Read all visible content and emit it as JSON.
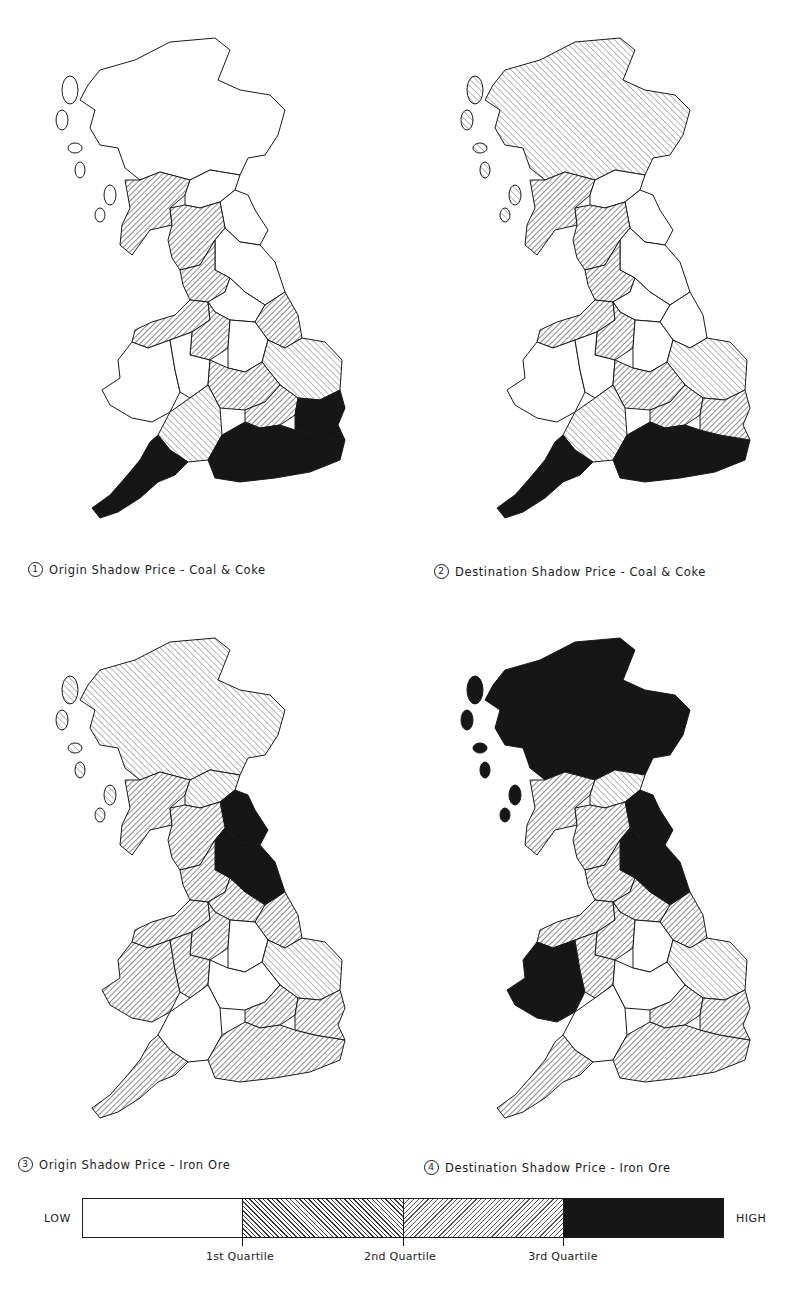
{
  "figure": {
    "panels": [
      {
        "number": "1",
        "caption": "Origin Shadow Price - Coal & Coke",
        "classes": {
          "highlands": "low",
          "southern_scotland": "q2",
          "borders": "low",
          "north_east": "low",
          "cumbria": "q2",
          "yorkshire_north": "low",
          "lancashire": "q2",
          "yorkshire_south": "low",
          "lincolnshire": "q2",
          "north_wales": "q2",
          "midlands_west": "q2",
          "midlands_east": "low",
          "wales": "low",
          "welsh_marches": "low",
          "east_anglia": "q3",
          "south_midlands": "q2",
          "severn_wessex": "q3",
          "london_home": "q2",
          "south_west": "high",
          "south_coast": "high",
          "kent_essex": "high"
        }
      },
      {
        "number": "2",
        "caption": "Destination Shadow Price - Coal & Coke",
        "classes": {
          "highlands": "q3",
          "southern_scotland": "q2",
          "borders": "low",
          "north_east": "low",
          "cumbria": "q2",
          "yorkshire_north": "low",
          "lancashire": "q2",
          "yorkshire_south": "low",
          "lincolnshire": "low",
          "north_wales": "q2",
          "midlands_west": "q2",
          "midlands_east": "low",
          "wales": "low",
          "welsh_marches": "low",
          "east_anglia": "q3",
          "south_midlands": "q2",
          "severn_wessex": "q3",
          "london_home": "q2",
          "south_west": "high",
          "south_coast": "high",
          "kent_essex": "q2"
        }
      },
      {
        "number": "3",
        "caption": "Origin Shadow Price - Iron Ore",
        "classes": {
          "highlands": "q3",
          "southern_scotland": "q2",
          "borders": "q3",
          "north_east": "high",
          "cumbria": "q2",
          "yorkshire_north": "high",
          "lancashire": "q2",
          "yorkshire_south": "q2",
          "lincolnshire": "q2",
          "north_wales": "q2",
          "midlands_west": "q2",
          "midlands_east": "low",
          "wales": "q2",
          "welsh_marches": "q2",
          "east_anglia": "q3",
          "south_midlands": "low",
          "severn_wessex": "low",
          "london_home": "q2",
          "south_west": "q2",
          "south_coast": "q2",
          "kent_essex": "q2"
        }
      },
      {
        "number": "4",
        "caption": "Destination Shadow Price - Iron Ore",
        "classes": {
          "highlands": "high",
          "southern_scotland": "q2",
          "borders": "q3",
          "north_east": "high",
          "cumbria": "q2",
          "yorkshire_north": "high",
          "lancashire": "q2",
          "yorkshire_south": "q2",
          "lincolnshire": "q2",
          "north_wales": "q2",
          "midlands_west": "q2",
          "midlands_east": "low",
          "wales": "high",
          "welsh_marches": "q2",
          "east_anglia": "q3",
          "south_midlands": "low",
          "severn_wessex": "low",
          "london_home": "q2",
          "south_west": "q2",
          "south_coast": "q2",
          "kent_essex": "q2"
        }
      }
    ]
  },
  "legend": {
    "low_label": "LOW",
    "high_label": "HIGH",
    "classes": [
      "low",
      "q2",
      "q3",
      "high"
    ],
    "ticks": [
      "1st Quartile",
      "2nd Quartile",
      "3rd Quartile"
    ]
  },
  "colors": {
    "ink": "#1a1a1a",
    "fill_high": "#161616",
    "background": "#ffffff"
  }
}
